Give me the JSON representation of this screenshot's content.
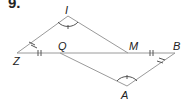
{
  "problem": {
    "number": "9."
  },
  "points": {
    "I": {
      "label": "I"
    },
    "Z": {
      "label": "Z"
    },
    "Q": {
      "label": "Q"
    },
    "M": {
      "label": "M"
    },
    "B": {
      "label": "B"
    },
    "A": {
      "label": "A"
    }
  },
  "markings": {
    "ZQ_MB": "single tick (congruent segments)",
    "ZI_AB": "double tick on segments near Z and B",
    "angle_I_A": "congruent angles with single tick arcs"
  },
  "colors": {
    "line": "#9a9a9a",
    "text": "#222222"
  }
}
